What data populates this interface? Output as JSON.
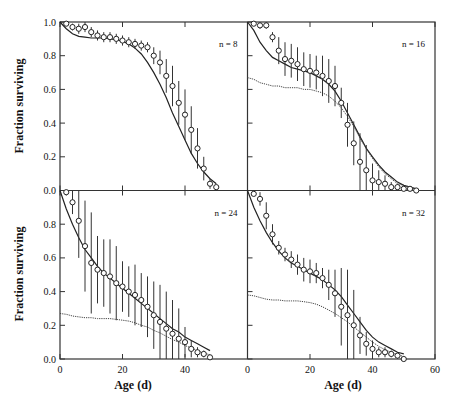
{
  "chart_data": {
    "type": "line",
    "layout": "2x2 panels with shared axes",
    "xlabel": "Age (d)",
    "ylabel": "Fraction surviving",
    "xlim": [
      0,
      60
    ],
    "ylim": [
      0,
      1.0
    ],
    "x_ticks": [
      0,
      20,
      40,
      60
    ],
    "x_tick_labels_left": [
      "0",
      "20",
      "40"
    ],
    "x_tick_labels_right": [
      "0",
      "20",
      "40",
      "60"
    ],
    "y_ticks": [
      0.0,
      0.2,
      0.4,
      0.6,
      0.8,
      1.0
    ],
    "y_tick_labels_top": [
      "0.0",
      "0.2",
      "0.4",
      "0.6",
      "0.8",
      "1.0"
    ],
    "y_tick_labels_bottom": [
      "0.0",
      "0.2",
      "0.4",
      "0.6",
      "0.8"
    ],
    "grid": false,
    "legend": "none",
    "panels": [
      {
        "label": "n = 8",
        "position": "top-left",
        "observed": {
          "x": [
            2,
            4,
            6,
            8,
            10,
            12,
            14,
            16,
            18,
            20,
            22,
            24,
            26,
            28,
            30,
            32,
            34,
            36,
            38,
            40,
            42,
            44,
            46,
            48,
            50
          ],
          "y": [
            0.99,
            0.97,
            0.96,
            0.97,
            0.94,
            0.92,
            0.91,
            0.91,
            0.9,
            0.89,
            0.88,
            0.87,
            0.86,
            0.85,
            0.8,
            0.76,
            0.68,
            0.62,
            0.52,
            0.45,
            0.36,
            0.25,
            0.13,
            0.04,
            0.02
          ],
          "err": [
            0.01,
            0.02,
            0.03,
            0.03,
            0.03,
            0.03,
            0.03,
            0.03,
            0.03,
            0.03,
            0.03,
            0.03,
            0.03,
            0.03,
            0.05,
            0.07,
            0.1,
            0.12,
            0.13,
            0.15,
            0.14,
            0.12,
            0.07,
            0.03,
            0.01
          ]
        },
        "model_solid": {
          "x": [
            0,
            2,
            4,
            6,
            8,
            10,
            12,
            14,
            16,
            18,
            20,
            22,
            24,
            26,
            28,
            30,
            32,
            34,
            36,
            38,
            40,
            42,
            44,
            46,
            48,
            50
          ],
          "y": [
            1.0,
            0.96,
            0.93,
            0.915,
            0.91,
            0.905,
            0.905,
            0.905,
            0.9,
            0.895,
            0.885,
            0.87,
            0.845,
            0.81,
            0.76,
            0.7,
            0.63,
            0.55,
            0.46,
            0.38,
            0.3,
            0.22,
            0.16,
            0.11,
            0.07,
            0.04
          ]
        },
        "model_dotted": null
      },
      {
        "label": "n = 16",
        "position": "top-right",
        "observed": {
          "x": [
            2,
            4,
            6,
            8,
            10,
            12,
            14,
            16,
            18,
            20,
            22,
            24,
            26,
            28,
            30,
            32,
            34,
            36,
            38,
            40,
            42,
            44,
            46,
            48,
            50,
            52,
            54
          ],
          "y": [
            0.99,
            0.98,
            0.98,
            0.91,
            0.83,
            0.78,
            0.77,
            0.75,
            0.72,
            0.71,
            0.7,
            0.68,
            0.65,
            0.62,
            0.52,
            0.39,
            0.28,
            0.17,
            0.12,
            0.06,
            0.05,
            0.04,
            0.02,
            0.02,
            0.01,
            0.01,
            0.0
          ],
          "err": [
            0.01,
            0.02,
            0.02,
            0.03,
            0.08,
            0.1,
            0.1,
            0.1,
            0.1,
            0.1,
            0.1,
            0.12,
            0.13,
            0.12,
            0.09,
            0.13,
            0.13,
            0.17,
            0.15,
            0.1,
            0.07,
            0.05,
            0.03,
            0.02,
            0.01,
            0.01,
            0.01
          ]
        },
        "model_solid": {
          "x": [
            0,
            2,
            4,
            6,
            8,
            10,
            12,
            14,
            16,
            18,
            20,
            22,
            24,
            26,
            28,
            30,
            32,
            34,
            36,
            38,
            40,
            42,
            44,
            46,
            48,
            50,
            52,
            54
          ],
          "y": [
            1.0,
            0.95,
            0.88,
            0.83,
            0.79,
            0.77,
            0.75,
            0.73,
            0.72,
            0.71,
            0.7,
            0.68,
            0.66,
            0.63,
            0.59,
            0.53,
            0.46,
            0.39,
            0.32,
            0.25,
            0.2,
            0.15,
            0.11,
            0.08,
            0.05,
            0.03,
            0.02,
            0.01
          ]
        },
        "model_dotted": {
          "x": [
            0,
            2,
            4,
            6,
            8,
            10,
            12,
            14,
            16,
            18,
            20,
            22,
            24,
            26,
            28,
            30,
            32,
            34,
            36,
            38,
            40,
            42,
            44,
            46,
            48,
            50,
            52,
            54
          ],
          "y": [
            0.67,
            0.66,
            0.64,
            0.63,
            0.62,
            0.62,
            0.61,
            0.61,
            0.61,
            0.6,
            0.6,
            0.59,
            0.58,
            0.56,
            0.53,
            0.49,
            0.44,
            0.38,
            0.31,
            0.25,
            0.19,
            0.14,
            0.1,
            0.07,
            0.04,
            0.03,
            0.02,
            0.01
          ]
        }
      },
      {
        "label": "n = 24",
        "position": "bottom-left",
        "observed": {
          "x": [
            2,
            4,
            6,
            8,
            10,
            12,
            14,
            16,
            18,
            20,
            22,
            24,
            26,
            28,
            30,
            32,
            34,
            36,
            38,
            40,
            42,
            44,
            46,
            48
          ],
          "y": [
            0.99,
            0.93,
            0.82,
            0.67,
            0.57,
            0.53,
            0.51,
            0.49,
            0.45,
            0.43,
            0.4,
            0.38,
            0.35,
            0.31,
            0.26,
            0.22,
            0.18,
            0.15,
            0.12,
            0.1,
            0.06,
            0.04,
            0.03,
            0.01
          ],
          "err": [
            0.02,
            0.07,
            0.22,
            0.27,
            0.3,
            0.2,
            0.2,
            0.22,
            0.22,
            0.15,
            0.15,
            0.18,
            0.16,
            0.18,
            0.2,
            0.22,
            0.22,
            0.2,
            0.18,
            0.09,
            0.05,
            0.03,
            0.02,
            0.01
          ]
        },
        "model_solid": {
          "x": [
            0,
            2,
            4,
            6,
            8,
            10,
            12,
            14,
            16,
            18,
            20,
            22,
            24,
            26,
            28,
            30,
            32,
            34,
            36,
            38,
            40,
            42,
            44,
            46,
            48
          ],
          "y": [
            1.0,
            0.89,
            0.8,
            0.72,
            0.65,
            0.6,
            0.55,
            0.51,
            0.48,
            0.45,
            0.42,
            0.39,
            0.36,
            0.33,
            0.3,
            0.27,
            0.24,
            0.21,
            0.18,
            0.16,
            0.13,
            0.11,
            0.09,
            0.07,
            0.05
          ]
        },
        "model_dotted": {
          "x": [
            0,
            2,
            4,
            6,
            8,
            10,
            12,
            14,
            16,
            18,
            20,
            22,
            24,
            26,
            28,
            30,
            32,
            34,
            36,
            38,
            40,
            42,
            44,
            46,
            48
          ],
          "y": [
            0.27,
            0.265,
            0.255,
            0.25,
            0.245,
            0.245,
            0.24,
            0.24,
            0.24,
            0.235,
            0.23,
            0.225,
            0.215,
            0.2,
            0.19,
            0.17,
            0.155,
            0.135,
            0.115,
            0.1,
            0.08,
            0.065,
            0.05,
            0.035,
            0.025
          ]
        }
      },
      {
        "label": "n = 32",
        "position": "bottom-right",
        "observed": {
          "x": [
            2,
            4,
            6,
            8,
            10,
            12,
            14,
            16,
            18,
            20,
            22,
            24,
            26,
            28,
            30,
            32,
            34,
            36,
            38,
            40,
            42,
            44,
            46,
            48,
            50
          ],
          "y": [
            0.98,
            0.95,
            0.85,
            0.74,
            0.66,
            0.62,
            0.59,
            0.56,
            0.53,
            0.52,
            0.51,
            0.48,
            0.44,
            0.39,
            0.31,
            0.26,
            0.2,
            0.14,
            0.09,
            0.06,
            0.04,
            0.04,
            0.03,
            0.02,
            0.0
          ],
          "err": [
            0.01,
            0.04,
            0.08,
            0.06,
            0.04,
            0.04,
            0.05,
            0.06,
            0.07,
            0.07,
            0.06,
            0.06,
            0.09,
            0.14,
            0.23,
            0.27,
            0.21,
            0.11,
            0.07,
            0.05,
            0.03,
            0.03,
            0.02,
            0.02,
            0.01
          ]
        },
        "model_solid": {
          "x": [
            0,
            2,
            4,
            6,
            8,
            10,
            12,
            14,
            16,
            18,
            20,
            22,
            24,
            26,
            28,
            30,
            32,
            34,
            36,
            38,
            40,
            42,
            44,
            46,
            48,
            50
          ],
          "y": [
            1.0,
            0.9,
            0.82,
            0.75,
            0.69,
            0.64,
            0.6,
            0.57,
            0.55,
            0.53,
            0.51,
            0.49,
            0.47,
            0.44,
            0.41,
            0.37,
            0.32,
            0.27,
            0.22,
            0.17,
            0.13,
            0.1,
            0.08,
            0.06,
            0.04,
            0.03
          ]
        },
        "model_dotted": {
          "x": [
            0,
            2,
            4,
            6,
            8,
            10,
            12,
            14,
            16,
            18,
            20,
            22,
            24,
            26,
            28,
            30,
            32,
            34,
            36,
            38,
            40,
            42,
            44,
            46,
            48,
            50
          ],
          "y": [
            0.38,
            0.375,
            0.365,
            0.355,
            0.35,
            0.35,
            0.345,
            0.345,
            0.345,
            0.34,
            0.335,
            0.325,
            0.31,
            0.29,
            0.27,
            0.245,
            0.22,
            0.19,
            0.16,
            0.13,
            0.1,
            0.075,
            0.055,
            0.04,
            0.025,
            0.015
          ]
        }
      }
    ]
  }
}
